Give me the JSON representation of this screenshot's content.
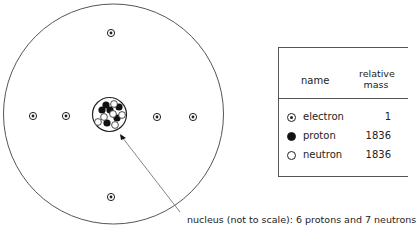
{
  "diagram": {
    "electron_count": 6,
    "nucleus": {
      "protons": 6,
      "neutrons": 7
    },
    "caption": "nucleus (not to scale):  6 protons and 7 neutrons"
  },
  "table": {
    "headers": {
      "name": "name",
      "mass_line1": "relative",
      "mass_line2": "mass"
    },
    "rows": [
      {
        "icon": "electron-icon",
        "name": "electron",
        "mass": "1"
      },
      {
        "icon": "proton-icon",
        "name": "proton",
        "mass": "1836"
      },
      {
        "icon": "neutron-icon",
        "name": "neutron",
        "mass": "1836"
      }
    ]
  },
  "colors": {
    "line": "#555555",
    "particle_dark": "#111111",
    "text": "#222222"
  }
}
